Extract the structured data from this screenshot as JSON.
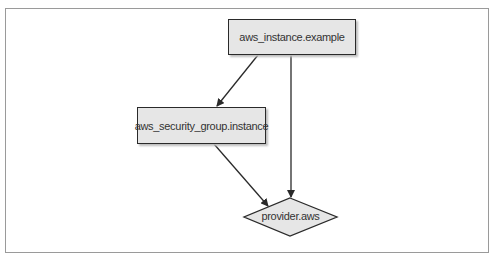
{
  "diagram": {
    "type": "dependency-graph",
    "nodes": {
      "instance": {
        "label": "aws_instance.example",
        "shape": "rectangle"
      },
      "security_group": {
        "label": "aws_security_group.instance",
        "shape": "rectangle"
      },
      "provider": {
        "label": "provider.aws",
        "shape": "diamond"
      }
    },
    "edges": [
      {
        "from": "aws_instance.example",
        "to": "aws_security_group.instance"
      },
      {
        "from": "aws_instance.example",
        "to": "provider.aws"
      },
      {
        "from": "aws_security_group.instance",
        "to": "provider.aws"
      }
    ],
    "colors": {
      "node_fill": "#e6e6e6",
      "node_stroke": "#2a2a2a",
      "edge": "#2a2a2a",
      "frame": "#9a9a9a"
    }
  }
}
